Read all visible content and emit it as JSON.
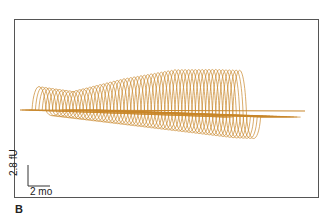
{
  "chart_data": {
    "type": "line",
    "subtype": "waterfall",
    "title": "",
    "panel_label": "B",
    "trace_color": "#c8862a",
    "trace_count": 60,
    "envelope_peak_height_px": [
      {
        "trace": 0,
        "height": 26
      },
      {
        "trace": 10,
        "height": 22
      },
      {
        "trace": 25,
        "height": 38
      },
      {
        "trace": 40,
        "height": 50
      },
      {
        "trace": 52,
        "height": 52
      },
      {
        "trace": 59,
        "height": 52
      }
    ],
    "scale_bar": {
      "y_label": "2.8 fU",
      "x_label": "2 mo"
    },
    "xlabel": "",
    "ylabel": "",
    "grid": false,
    "legend": null
  }
}
